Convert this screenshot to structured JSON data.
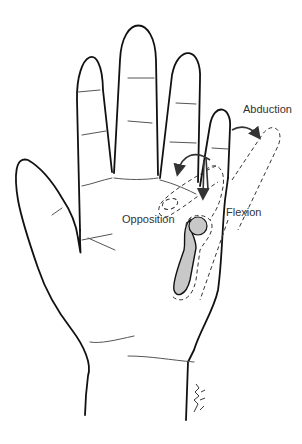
{
  "figure": {
    "labels": {
      "abduction": "Abduction",
      "opposition": "Opposition",
      "flexion": "Flexion"
    },
    "colors": {
      "outline": "#111111",
      "crease": "#444444",
      "dashed": "#333333",
      "bone_fill": "#c8c8c8",
      "arrow": "#333333",
      "background": "#ffffff"
    }
  }
}
